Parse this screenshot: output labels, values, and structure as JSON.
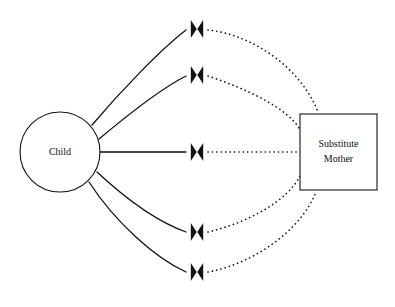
{
  "diagram": {
    "type": "attachment-interaction-diagram",
    "background_color": "#ffffff",
    "line_color": "#111111",
    "nodes": [
      {
        "id": "child",
        "shape": "circle",
        "label": "Child",
        "cx": 60,
        "cy": 152,
        "r": 40
      },
      {
        "id": "substitute_mother",
        "shape": "rect",
        "label_line1": "Substitute",
        "label_line2": "Mother",
        "x": 300,
        "y": 114,
        "width": 77,
        "height": 76
      }
    ],
    "connectors": [
      {
        "id": "connector-1",
        "marker_x": 197,
        "marker_y": 29,
        "solid_style": "solid",
        "dotted_style": "dotted",
        "arrow_style": "double-head-bowtie"
      },
      {
        "id": "connector-2",
        "marker_x": 197,
        "marker_y": 75,
        "solid_style": "solid",
        "dotted_style": "dotted",
        "arrow_style": "double-head-bowtie"
      },
      {
        "id": "connector-3",
        "marker_x": 197,
        "marker_y": 152,
        "solid_style": "solid",
        "dotted_style": "dotted",
        "arrow_style": "double-head-bowtie"
      },
      {
        "id": "connector-4",
        "marker_x": 197,
        "marker_y": 232,
        "solid_style": "solid",
        "dotted_style": "dotted",
        "arrow_style": "double-head-bowtie"
      },
      {
        "id": "connector-5",
        "marker_x": 197,
        "marker_y": 272,
        "solid_style": "solid",
        "dotted_style": "dotted",
        "arrow_style": "double-head-bowtie"
      }
    ],
    "paths": {
      "solid_1": "M 92,125 C 120,92 160,50 186,30",
      "solid_2": "M 99,139 C 130,113 160,89 186,76",
      "solid_3": "M 100,152 L 186,152",
      "solid_4": "M 97,172 C 125,198 158,222 186,232",
      "solid_5": "M 89,182 C 115,222 155,258 186,272",
      "dotted_1": "M 208,30 C 250,34 300,66 318,112",
      "dotted_2": "M 208,76 C 250,90 290,110 300,130",
      "dotted_3": "M 208,152 L 298,152",
      "dotted_4": "M 208,232 C 250,222 288,200 300,176",
      "dotted_5": "M 208,272 C 252,264 300,232 316,192"
    }
  }
}
